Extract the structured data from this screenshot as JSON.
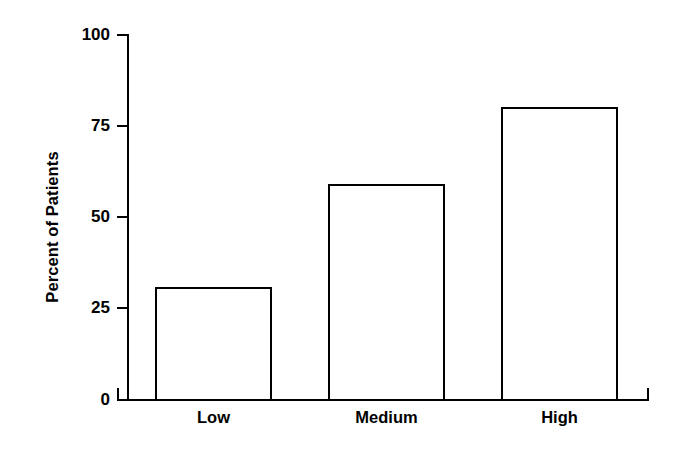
{
  "chart_data": {
    "type": "bar",
    "title": "",
    "subtitle": "",
    "xlabel": "",
    "ylabel": "Percent of Patients",
    "categories": [
      "Low",
      "Medium",
      "High"
    ],
    "values": [
      31,
      59,
      80
    ],
    "ylim": [
      0,
      100
    ],
    "yticks": [
      0,
      25,
      50,
      75,
      100
    ],
    "ytick_labels": [
      "0",
      "25",
      "50",
      "75",
      "100"
    ],
    "grid": false,
    "legend": null,
    "series": [
      {
        "name": "Percent of Patients",
        "values": [
          31,
          59,
          80
        ],
        "fill_color": "#ffffff",
        "edge_color": "#000000"
      }
    ],
    "annotations": []
  },
  "style": {
    "background": "#ffffff",
    "axis_color": "#000000",
    "text_color": "#000000"
  }
}
